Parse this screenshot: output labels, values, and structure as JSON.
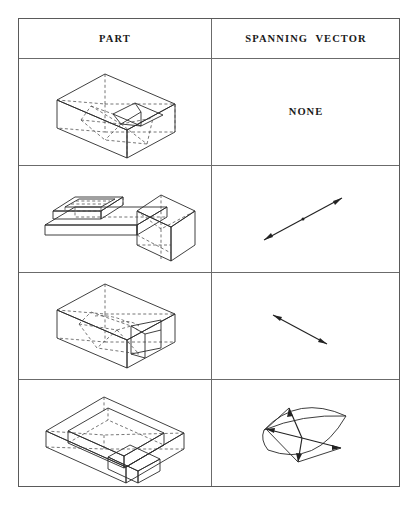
{
  "table": {
    "headers": {
      "part": "PART",
      "spanning_vector": "SPANNING  VECTOR"
    },
    "rows": [
      {
        "id": "row-1",
        "part_label": "rectangular-block-with-triangular-pocket",
        "vector_type": "none",
        "vector_text": "NONE",
        "vector_description": "no spanning vector"
      },
      {
        "id": "row-2",
        "part_label": "l-shaped-bracket-with-slot",
        "vector_type": "single-arrow",
        "vector_text": "",
        "vector_description": "double-headed arrow pointing up and to the right"
      },
      {
        "id": "row-3",
        "part_label": "rectangular-block-with-through-cavity",
        "vector_type": "single-arrow",
        "vector_text": "",
        "vector_description": "short double-headed arrow pointing down and to the right"
      },
      {
        "id": "row-4",
        "part_label": "open-tray-with-rectangular-pocket",
        "vector_type": "lens-of-vectors",
        "vector_text": "",
        "vector_description": "lens shaped region containing several radiating arrows"
      }
    ]
  },
  "style": {
    "frame_color": "#5a5a5a",
    "grid_color": "#6b6b6b",
    "solid_line_color": "#2b2b2b",
    "hidden_line_color": "#4a4a4a",
    "vector_color": "#222222",
    "background": "#ffffff"
  }
}
